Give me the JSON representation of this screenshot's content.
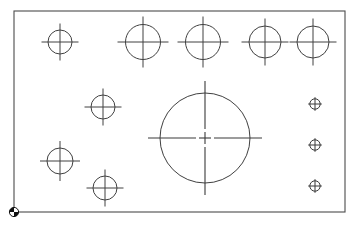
{
  "drawing": {
    "title": "",
    "background_color": "#ffffff",
    "line_color": "#404040",
    "plate_outline_color": "#4c4c4c",
    "origin_marker_color": "#111111",
    "plate": {
      "x": 14,
      "y": 11,
      "width": 331,
      "height": 201
    },
    "origin_marker": {
      "name": "origin-marker",
      "x": 14,
      "y": 212,
      "radius": 4.6
    },
    "center_holes": [
      {
        "label": "D2",
        "cx": 60,
        "cy": 42,
        "r": 12,
        "tick": 6.5,
        "label_dx": 10,
        "label_dy": -8
      },
      {
        "label": "C2",
        "cx": 143,
        "cy": 42,
        "r": 17.5,
        "tick": 8,
        "label_dx": 14.5,
        "label_dy": -12
      },
      {
        "label": "C3",
        "cx": 203,
        "cy": 42,
        "r": 17.5,
        "tick": 8,
        "label_dx": 14.5,
        "label_dy": -12
      },
      {
        "label": "C1",
        "cx": 265,
        "cy": 42,
        "r": 16,
        "tick": 7.5,
        "label_dx": 13,
        "label_dy": -11
      },
      {
        "label": "C4",
        "cx": 313,
        "cy": 42,
        "r": 16,
        "tick": 7.5,
        "label_dx": 13,
        "label_dy": -11
      },
      {
        "label": "D3",
        "cx": 103,
        "cy": 107,
        "r": 12,
        "tick": 6.5,
        "label_dx": 10,
        "label_dy": -8
      },
      {
        "label": "D1",
        "cx": 60,
        "cy": 161,
        "r": 13,
        "tick": 7,
        "label_dx": 11,
        "label_dy": -9
      },
      {
        "label": "D4",
        "cx": 105,
        "cy": 188,
        "r": 12,
        "tick": 6.5,
        "label_dx": 10,
        "label_dy": -8
      }
    ],
    "big_hole": {
      "label": "B1",
      "cx": 205,
      "cy": 138,
      "r": 45,
      "tick": 12,
      "label_x": 234,
      "label_y": 102
    },
    "point_markers": [
      {
        "label": "A2",
        "cx": 315,
        "cy": 104,
        "r": 5.2,
        "label_dx": 5.5,
        "label_dy": -5
      },
      {
        "label": "A1",
        "cx": 315,
        "cy": 145,
        "r": 5.2,
        "label_dx": 5.5,
        "label_dy": -5
      },
      {
        "label": "A3",
        "cx": 315,
        "cy": 186,
        "r": 5.2,
        "label_dx": 5.5,
        "label_dy": -5
      }
    ]
  }
}
